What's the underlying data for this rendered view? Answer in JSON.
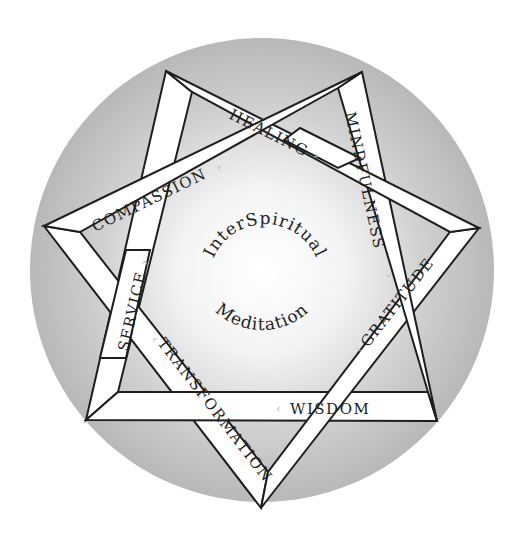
{
  "diagram": {
    "title": "InterSpiritual Meditation",
    "center": {
      "line1": "InterSpiritual",
      "line2": "Meditation"
    },
    "colors": {
      "circle_outer": "#b9b9b9",
      "circle_inner": "#ffffff",
      "band_fill": "#ffffff",
      "band_stroke": "#1e1e1e",
      "arrow": "#bdbdbd",
      "text": "#1e1e1e"
    },
    "bands": [
      {
        "label": "HEALING",
        "arrow": "›"
      },
      {
        "label": "MINDFULNESS",
        "arrow": "›"
      },
      {
        "label": "GRATITUDE",
        "arrow": "‹"
      },
      {
        "label": "WISDOM",
        "arrow": "‹"
      },
      {
        "label": "TRANSFORMATION",
        "arrow": "‹"
      },
      {
        "label": "SERVICE",
        "arrow": "›"
      },
      {
        "label": "COMPASSION",
        "arrow": "›"
      }
    ]
  }
}
